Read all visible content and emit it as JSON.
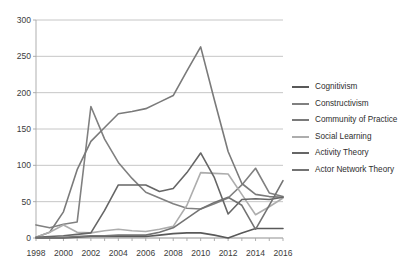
{
  "chart_data": {
    "type": "line",
    "title": "",
    "xlabel": "",
    "ylabel": "",
    "xlim": [
      1998,
      2016
    ],
    "ylim": [
      0,
      300
    ],
    "ytick_labels": [
      "0",
      "50",
      "100",
      "150",
      "200",
      "250",
      "300"
    ],
    "yticks": [
      0,
      50,
      100,
      150,
      200,
      250,
      300
    ],
    "xtick_labels": [
      "1998",
      "2000",
      "2002",
      "2004",
      "2006",
      "2008",
      "2010",
      "2012",
      "2014",
      "2016"
    ],
    "xticks": [
      1998,
      2000,
      2002,
      2004,
      2006,
      2008,
      2010,
      2012,
      2014,
      2016
    ],
    "grid": true,
    "legend_position": "right",
    "x": [
      1998,
      1999,
      2000,
      2001,
      2002,
      2003,
      2004,
      2005,
      2006,
      2007,
      2008,
      2009,
      2010,
      2011,
      2012,
      2013,
      2014,
      2015,
      2016
    ],
    "series": [
      {
        "name": "Cognitivism",
        "color": "#595959",
        "values": [
          0,
          0,
          0,
          1,
          2,
          2,
          2,
          2,
          2,
          4,
          6,
          7,
          7,
          4,
          0,
          7,
          13,
          13,
          13
        ]
      },
      {
        "name": "Constructivism",
        "color": "#808080",
        "values": [
          18,
          14,
          19,
          22,
          181,
          136,
          104,
          82,
          63,
          55,
          47,
          41,
          40,
          47,
          55,
          73,
          96,
          62,
          57
        ]
      },
      {
        "name": "Community of Practice",
        "color": "#7a7a7a",
        "values": [
          1,
          8,
          36,
          94,
          133,
          152,
          171,
          174,
          178,
          187,
          196,
          230,
          263,
          190,
          119,
          75,
          60,
          57,
          56
        ]
      },
      {
        "name": "Social Learning",
        "color": "#adadad",
        "values": [
          1,
          8,
          18,
          8,
          7,
          10,
          12,
          10,
          9,
          12,
          16,
          45,
          90,
          89,
          88,
          60,
          32,
          43,
          55
        ]
      },
      {
        "name": "Activity Theory",
        "color": "#666666",
        "values": [
          1,
          2,
          3,
          5,
          7,
          38,
          73,
          73,
          73,
          64,
          68,
          90,
          117,
          83,
          33,
          53,
          54,
          53,
          56
        ]
      },
      {
        "name": "Actor Network Theory",
        "color": "#737373",
        "values": [
          0,
          0,
          1,
          2,
          3,
          3,
          4,
          4,
          4,
          8,
          14,
          27,
          40,
          49,
          56,
          45,
          12,
          45,
          79
        ]
      }
    ]
  },
  "legend": {
    "items": [
      {
        "label": "Cognitivism",
        "color": "#595959"
      },
      {
        "label": "Constructivism",
        "color": "#808080"
      },
      {
        "label": "Community of Practice",
        "color": "#7a7a7a"
      },
      {
        "label": "Social Learning",
        "color": "#adadad"
      },
      {
        "label": "Activity Theory",
        "color": "#666666"
      },
      {
        "label": "Actor Network Theory",
        "color": "#737373"
      }
    ]
  },
  "axes": {
    "grid_color": "#bfbfbf",
    "axis_color": "#a6a6a6",
    "tick_text_color": "#3b3b3b"
  }
}
